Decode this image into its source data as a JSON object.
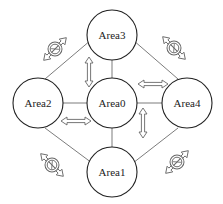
{
  "diagram": {
    "nodes": [
      {
        "id": "area0",
        "label": "Area0",
        "cx": 112,
        "cy": 103,
        "r": 25
      },
      {
        "id": "area1",
        "label": "Area1",
        "cx": 112,
        "cy": 172,
        "r": 25
      },
      {
        "id": "area2",
        "label": "Area2",
        "cx": 38,
        "cy": 103,
        "r": 25
      },
      {
        "id": "area3",
        "label": "Area3",
        "cx": 112,
        "cy": 35,
        "r": 25
      },
      {
        "id": "area4",
        "label": "Area4",
        "cx": 187,
        "cy": 103,
        "r": 25
      }
    ],
    "links": [
      {
        "from": "area0",
        "to": "area1",
        "type": "line"
      },
      {
        "from": "area0",
        "to": "area2",
        "type": "line"
      },
      {
        "from": "area0",
        "to": "area3",
        "type": "line"
      },
      {
        "from": "area0",
        "to": "area4",
        "type": "line"
      },
      {
        "from": "area2",
        "to": "area3",
        "type": "line",
        "blocked": true
      },
      {
        "from": "area3",
        "to": "area4",
        "type": "line",
        "blocked": true
      },
      {
        "from": "area2",
        "to": "area1",
        "type": "line",
        "blocked": true
      },
      {
        "from": "area4",
        "to": "area1",
        "type": "line",
        "blocked": true
      }
    ],
    "colors": {
      "stroke": "#222222",
      "arrow": "#666666",
      "background": "#ffffff"
    }
  }
}
